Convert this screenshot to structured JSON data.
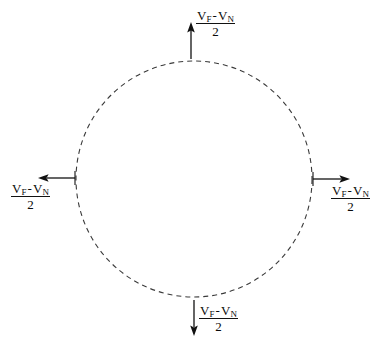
{
  "diagram": {
    "background_color": "#ffffff",
    "stroke_color": "#333333",
    "arrow_color": "#111111",
    "text_color": "#0a0a0a",
    "circle": {
      "center_x": 194,
      "center_y": 179,
      "radius": 118,
      "style": "dashed",
      "dash_on": 5,
      "dash_off": 4
    },
    "arrows": [
      {
        "id": "top",
        "direction": "up",
        "length": 32,
        "label_id": "label-top"
      },
      {
        "id": "right",
        "direction": "right",
        "length": 35,
        "label_id": "label-right"
      },
      {
        "id": "left",
        "direction": "left",
        "length": 38,
        "label_id": "label-left"
      },
      {
        "id": "bottom",
        "direction": "down",
        "length": 36,
        "label_id": "label-bottom"
      }
    ],
    "labels": {
      "top": {
        "numerator_first": "V",
        "numerator_first_sub": "F",
        "operator": "-",
        "numerator_second": "V",
        "numerator_second_sub": "N",
        "denominator": "2"
      },
      "right": {
        "numerator_first": "V",
        "numerator_first_sub": "F",
        "operator": "-",
        "numerator_second": "V",
        "numerator_second_sub": "N",
        "denominator": "2"
      },
      "left": {
        "numerator_first": "V",
        "numerator_first_sub": "F",
        "operator": "-",
        "numerator_second": "V",
        "numerator_second_sub": "N",
        "denominator": "2"
      },
      "bottom": {
        "numerator_first": "V",
        "numerator_first_sub": "F",
        "operator": "-",
        "numerator_second": "V",
        "numerator_second_sub": "N",
        "denominator": "2"
      }
    }
  }
}
